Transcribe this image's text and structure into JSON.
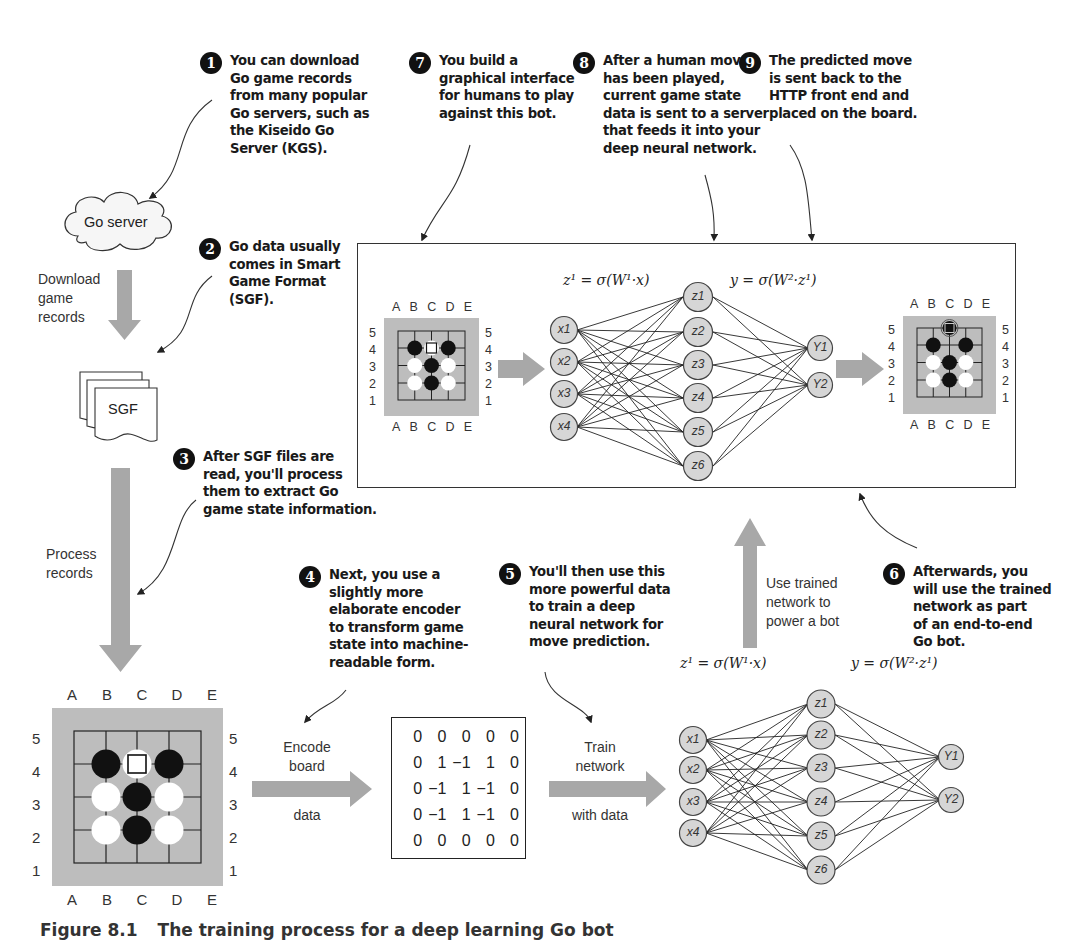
{
  "callouts": [
    {
      "num": "1",
      "text": "You can download\nGo game records\nfrom many popular\nGo servers, such as\nthe Kiseido Go\nServer (KGS)."
    },
    {
      "num": "2",
      "text": "Go data usually\ncomes in Smart\nGame Format\n(SGF)."
    },
    {
      "num": "3",
      "text": "After SGF files are\nread, you'll process\nthem to extract Go\ngame state information."
    },
    {
      "num": "4",
      "text": "Next, you use a\nslightly more\nelaborate encoder\nto transform game\nstate into machine-\nreadable form."
    },
    {
      "num": "5",
      "text": "You'll then use this\nmore powerful data\nto train a deep\nneural network for\nmove prediction."
    },
    {
      "num": "6",
      "text": "Afterwards, you\nwill use the trained\nnetwork as part\nof an end-to-end\nGo bot."
    },
    {
      "num": "7",
      "text": "You build a\ngraphical interface\nfor humans to play\nagainst this bot."
    },
    {
      "num": "8",
      "text": "After a human move\nhas been played,\ncurrent game state\ndata is sent to a server\nthat feeds it into your\ndeep neural network."
    },
    {
      "num": "9",
      "text": "The predicted move\nis sent back to the\nHTTP front end and\nplaced on the board."
    }
  ],
  "nodes": {
    "go_server": "Go server",
    "sgf_file": "SGF"
  },
  "arrow_labels": {
    "download": "Download\ngame\nrecords",
    "process": "Process\nrecords",
    "encode_top": "Encode\nboard",
    "encode_bottom": "data",
    "train_top": "Train\nnetwork",
    "train_bottom": "with data",
    "use_trained": "Use trained\nnetwork to\npower a bot"
  },
  "board": {
    "columns": [
      "A",
      "B",
      "C",
      "D",
      "E"
    ],
    "rows": [
      "5",
      "4",
      "3",
      "2",
      "1"
    ],
    "stones": [
      {
        "col": "B",
        "row": "4",
        "color": "black"
      },
      {
        "col": "C",
        "row": "4",
        "color": "white",
        "marked": true
      },
      {
        "col": "D",
        "row": "4",
        "color": "black"
      },
      {
        "col": "B",
        "row": "3",
        "color": "white"
      },
      {
        "col": "C",
        "row": "3",
        "color": "black"
      },
      {
        "col": "D",
        "row": "3",
        "color": "white"
      },
      {
        "col": "B",
        "row": "2",
        "color": "white"
      },
      {
        "col": "C",
        "row": "2",
        "color": "black"
      },
      {
        "col": "D",
        "row": "2",
        "color": "white"
      }
    ],
    "predicted_move": {
      "col": "C",
      "row": "5",
      "color": "black",
      "marked": true
    }
  },
  "encoded_matrix": [
    [
      "0",
      "0",
      "0",
      "0",
      "0"
    ],
    [
      "0",
      "1",
      "−1",
      "1",
      "0"
    ],
    [
      "0",
      "−1",
      "1",
      "−1",
      "0"
    ],
    [
      "0",
      "−1",
      "1",
      "−1",
      "0"
    ],
    [
      "0",
      "0",
      "0",
      "0",
      "0"
    ]
  ],
  "network": {
    "formula_hidden": "z¹ = σ(W¹·x)",
    "formula_output": "y = σ(W²·z¹)",
    "inputs": [
      "x1",
      "x2",
      "x3",
      "x4"
    ],
    "hidden": [
      "z1",
      "z2",
      "z3",
      "z4",
      "z5",
      "z6"
    ],
    "outputs": [
      "Y1",
      "Y2"
    ]
  },
  "caption": {
    "figure": "Figure 8.1",
    "text": "The training process for a deep learning Go bot"
  },
  "colors": {
    "arrow_gray": "#a8a8a8",
    "board_gray": "#bdbdbd",
    "node_fill": "#d6d6d6",
    "badge": "#111111"
  }
}
